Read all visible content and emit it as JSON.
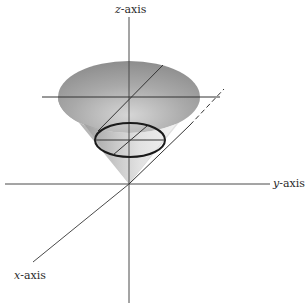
{
  "diagram": {
    "labels": {
      "z_axis": {
        "var": "z",
        "suffix": "-axis"
      },
      "y_axis": {
        "var": "y",
        "suffix": "-axis"
      },
      "x_axis": {
        "var": "x",
        "suffix": "-axis"
      }
    },
    "colors": {
      "axis": "#4a4a4a",
      "cone_light": "#e6e6e6",
      "cone_mid": "#bdbdbd",
      "cone_dark": "#8c8c8c",
      "ellipse": "#1a1a1a",
      "background": "#ffffff"
    },
    "geometry": {
      "origin": [
        129,
        184
      ],
      "top_rim": {
        "cx": 129,
        "cy": 97,
        "rx": 71,
        "ry": 36
      },
      "cross_section": {
        "cx": 130,
        "cy": 140,
        "rx": 35,
        "ry": 17
      }
    }
  }
}
